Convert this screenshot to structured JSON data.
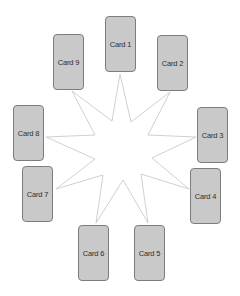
{
  "diagram": {
    "star": {
      "stroke": "#c4c4c4",
      "fill": "#ffffff",
      "points": [
        [
          120,
          74
        ],
        [
          131,
          122
        ],
        [
          170,
          92
        ],
        [
          148,
          135
        ],
        [
          196,
          137
        ],
        [
          152,
          158
        ],
        [
          189,
          189
        ],
        [
          141,
          174
        ],
        [
          148,
          223
        ],
        [
          123,
          180
        ],
        [
          96,
          223
        ],
        [
          103,
          175
        ],
        [
          56,
          189
        ],
        [
          95,
          159
        ],
        [
          46,
          137
        ],
        [
          95,
          135
        ],
        [
          72,
          91
        ],
        [
          112,
          121
        ]
      ]
    },
    "cards": [
      {
        "label": "Card 1",
        "x": 105,
        "y": 16
      },
      {
        "label": "Card 2",
        "x": 157,
        "y": 35
      },
      {
        "label": "Card 3",
        "x": 197,
        "y": 107
      },
      {
        "label": "Card 4",
        "x": 190,
        "y": 168
      },
      {
        "label": "Card 5",
        "x": 134,
        "y": 225
      },
      {
        "label": "Card 6",
        "x": 78,
        "y": 225
      },
      {
        "label": "Card 7",
        "x": 22,
        "y": 166
      },
      {
        "label": "Card 8",
        "x": 13,
        "y": 105
      },
      {
        "label": "Card 9",
        "x": 53,
        "y": 34
      }
    ],
    "colors": {
      "card_fill": "#c9c9c9",
      "card_border": "#7d7d7d",
      "card_text": "#2e2e2e"
    }
  }
}
